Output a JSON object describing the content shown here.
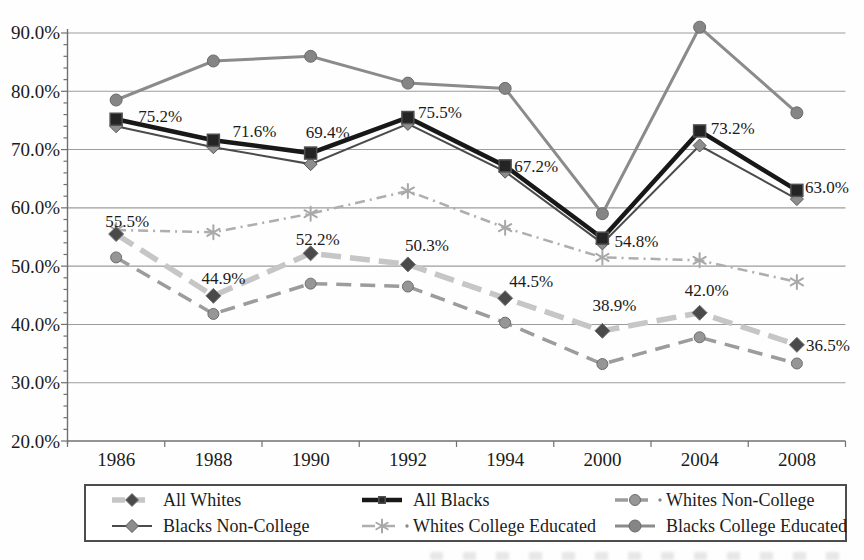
{
  "chart_data": {
    "type": "line",
    "title": "",
    "xlabel": "",
    "ylabel": "",
    "ylim": [
      20,
      90
    ],
    "grid": "horizontal",
    "legend_position": "bottom",
    "categories": [
      "1986",
      "1988",
      "1990",
      "1992",
      "1994",
      "2000",
      "2004",
      "2008"
    ],
    "y_ticks": [
      "90.0%",
      "80.0%",
      "70.0%",
      "60.0%",
      "50.0%",
      "40.0%",
      "30.0%",
      "20.0%"
    ],
    "series": [
      {
        "id": "all-whites",
        "name": "All Whites",
        "values": [
          55.5,
          44.9,
          52.2,
          50.3,
          44.5,
          38.9,
          42.0,
          36.5
        ],
        "data_labels": [
          "55.5%",
          "44.9%",
          "52.2%",
          "50.3%",
          "44.5%",
          "38.9%",
          "42.0%",
          "36.5%"
        ],
        "label_offsets": [
          [
            11,
            -13
          ],
          [
            10,
            -18
          ],
          [
            7,
            -14
          ],
          [
            19,
            -19
          ],
          [
            26,
            -17
          ],
          [
            12,
            -26
          ],
          [
            7,
            -23
          ],
          [
            31,
            0
          ]
        ],
        "line_color": "#c6c6c6",
        "line_width": 5.5,
        "dash": "20 9",
        "marker": "diamond",
        "marker_color": "#4a4a4a",
        "marker_edge": "#777777",
        "marker_size": 7.5,
        "leading_dot": false
      },
      {
        "id": "all-blacks",
        "name": "All Blacks",
        "values": [
          75.2,
          71.6,
          69.4,
          75.5,
          67.2,
          54.8,
          73.2,
          63.0
        ],
        "data_labels": [
          "75.2%",
          "71.6%",
          "69.4%",
          "75.5%",
          "67.2%",
          "54.8%",
          "73.2%",
          "63.0%"
        ],
        "label_offsets": [
          [
            44,
            -3
          ],
          [
            41,
            -9
          ],
          [
            17,
            -21
          ],
          [
            32,
            -6
          ],
          [
            31,
            0
          ],
          [
            34,
            3
          ],
          [
            33,
            -3
          ],
          [
            30,
            -3
          ]
        ],
        "line_color": "#181818",
        "line_width": 4.5,
        "dash": null,
        "marker": "square",
        "marker_color": "#242424",
        "marker_edge": "#505050",
        "marker_size": 12,
        "leading_dot": false
      },
      {
        "id": "whites-non-college",
        "name": "Whites Non-College",
        "values": [
          51.5,
          41.8,
          47.0,
          46.5,
          40.3,
          33.2,
          37.8,
          33.3
        ],
        "data_labels": null,
        "label_offsets": null,
        "line_color": "#9c9c9c",
        "line_width": 3.5,
        "dash": "15 9",
        "marker": "circle",
        "marker_color": "#969696",
        "marker_edge": "#6e6e6e",
        "marker_size": 5.5,
        "leading_dot": true
      },
      {
        "id": "blacks-non-college",
        "name": "Blacks Non-College",
        "values": [
          74.0,
          70.4,
          67.5,
          74.4,
          66.2,
          53.9,
          70.7,
          61.5
        ],
        "data_labels": null,
        "label_offsets": null,
        "line_color": "#4b4b4b",
        "line_width": 2,
        "dash": null,
        "marker": "diamond",
        "marker_color": "#8d8d8d",
        "marker_edge": "#585858",
        "marker_size": 6.5,
        "leading_dot": false
      },
      {
        "id": "whites-college-educated",
        "name": "Whites College Educated",
        "values": [
          56.2,
          55.8,
          59.0,
          62.9,
          56.6,
          51.5,
          51.0,
          47.3
        ],
        "data_labels": null,
        "label_offsets": null,
        "line_color": "#aeaeae",
        "line_width": 2.5,
        "dash": "10 5 2 5",
        "marker": "asterisk",
        "marker_color": "#a8a8a8",
        "marker_edge": "#a8a8a8",
        "marker_size": 7,
        "leading_dot": true
      },
      {
        "id": "blacks-college-educated",
        "name": "Blacks College Educated",
        "values": [
          78.5,
          85.2,
          86.0,
          81.4,
          80.5,
          59.0,
          91.0,
          76.3
        ],
        "data_labels": null,
        "label_offsets": null,
        "line_color": "#8b8b8b",
        "line_width": 3,
        "dash": null,
        "marker": "circle",
        "marker_color": "#858585",
        "marker_edge": "#6a6a6a",
        "marker_size": 6,
        "leading_dot": false
      }
    ],
    "legend_order": [
      "all-whites",
      "all-blacks",
      "whites-non-college",
      "blacks-non-college",
      "whites-college-educated",
      "blacks-college-educated"
    ],
    "colors": {
      "text": "#1b1b1b",
      "gridline": "#9c9c9c",
      "axis": "#707070"
    }
  }
}
